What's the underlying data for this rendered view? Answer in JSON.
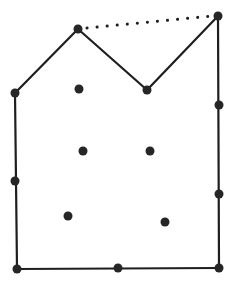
{
  "diagram": {
    "type": "lattice-polygon",
    "stroke_color": "#1e1e1e",
    "dot_color": "#262626",
    "boundary_points": [
      {
        "x": 15,
        "y": 93
      },
      {
        "x": 78,
        "y": 29
      },
      {
        "x": 147,
        "y": 90
      },
      {
        "x": 218,
        "y": 16
      },
      {
        "x": 219,
        "y": 105
      },
      {
        "x": 219,
        "y": 194
      },
      {
        "x": 219,
        "y": 268
      },
      {
        "x": 118,
        "y": 268
      },
      {
        "x": 17,
        "y": 269
      },
      {
        "x": 15,
        "y": 181
      }
    ],
    "polygon_edges_solid": [
      [
        15,
        93,
        78,
        29
      ],
      [
        78,
        29,
        147,
        90
      ],
      [
        147,
        90,
        218,
        16
      ],
      [
        218,
        16,
        219,
        268
      ],
      [
        219,
        268,
        17,
        269
      ],
      [
        17,
        269,
        15,
        93
      ]
    ],
    "dotted_segment": {
      "x1": 78,
      "y1": 29,
      "x2": 218,
      "y2": 16
    },
    "interior_points": [
      {
        "x": 79,
        "y": 89
      },
      {
        "x": 83,
        "y": 151
      },
      {
        "x": 150,
        "y": 151
      },
      {
        "x": 68,
        "y": 216
      },
      {
        "x": 165,
        "y": 222
      }
    ]
  }
}
